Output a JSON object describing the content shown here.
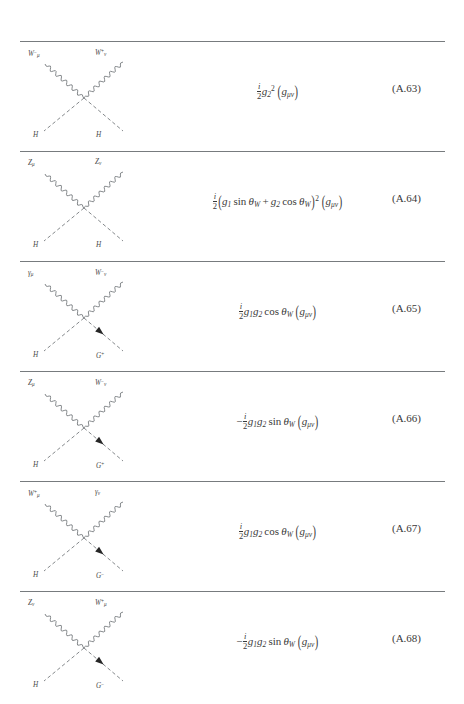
{
  "page": {
    "background": "#ffffff",
    "rule_color": "#777b7e",
    "text_color": "#3a3a3a"
  },
  "rows": [
    {
      "id": "row-a63",
      "diagram": {
        "name": "feynman-diagram-wwhh",
        "top_left": {
          "symbol": "W",
          "sub": "μ",
          "sup": "−"
        },
        "top_right": {
          "symbol": "W",
          "sub": "ν",
          "sup": "+"
        },
        "bottom_left": {
          "symbol": "H",
          "sub": "",
          "sup": ""
        },
        "bottom_right": {
          "symbol": "H",
          "sub": "",
          "sup": ""
        },
        "top_left_style": "wavy",
        "top_right_style": "wavy",
        "bottom_left_style": "dashed",
        "bottom_right_style": "dashed",
        "arrow": false
      },
      "equation": {
        "sign": "",
        "coefficient_num": "i",
        "coefficient_den": "2",
        "body": "g₂²",
        "tensor": "gμν",
        "plain": "i/2 g2^2 (g_munu)"
      },
      "tag": "(A.63)"
    },
    {
      "id": "row-a64",
      "diagram": {
        "name": "feynman-diagram-zzhh",
        "top_left": {
          "symbol": "Z",
          "sub": "μ",
          "sup": ""
        },
        "top_right": {
          "symbol": "Z",
          "sub": "ν",
          "sup": ""
        },
        "bottom_left": {
          "symbol": "H",
          "sub": "",
          "sup": ""
        },
        "bottom_right": {
          "symbol": "H",
          "sub": "",
          "sup": ""
        },
        "top_left_style": "wavy",
        "top_right_style": "wavy",
        "bottom_left_style": "dashed",
        "bottom_right_style": "dashed",
        "arrow": false
      },
      "equation": {
        "sign": "",
        "coefficient_num": "i",
        "coefficient_den": "2",
        "body": "(g₁ sin θW + g₂ cos θW)²",
        "tensor": "gμν",
        "plain": "i/2 (g1 sin thetaW + g2 cos thetaW)^2 (g_munu)"
      },
      "tag": "(A.64)"
    },
    {
      "id": "row-a65",
      "diagram": {
        "name": "feynman-diagram-gamma-w-h-gplus",
        "top_left": {
          "symbol": "γ",
          "sub": "μ",
          "sup": ""
        },
        "top_right": {
          "symbol": "W",
          "sub": "ν",
          "sup": "−"
        },
        "bottom_left": {
          "symbol": "H",
          "sub": "",
          "sup": ""
        },
        "bottom_right": {
          "symbol": "G",
          "sub": "",
          "sup": "+"
        },
        "top_left_style": "wavy",
        "top_right_style": "wavy",
        "bottom_left_style": "dashed",
        "bottom_right_style": "dashed",
        "arrow": true
      },
      "equation": {
        "sign": "",
        "coefficient_num": "i",
        "coefficient_den": "2",
        "body": "g₁g₂ cos θW",
        "tensor": "gμν",
        "plain": "i/2 g1 g2 cos thetaW (g_munu)"
      },
      "tag": "(A.65)"
    },
    {
      "id": "row-a66",
      "diagram": {
        "name": "feynman-diagram-z-w-h-gplus",
        "top_left": {
          "symbol": "Z",
          "sub": "μ",
          "sup": ""
        },
        "top_right": {
          "symbol": "W",
          "sub": "ν",
          "sup": "−"
        },
        "bottom_left": {
          "symbol": "H",
          "sub": "",
          "sup": ""
        },
        "bottom_right": {
          "symbol": "G",
          "sub": "",
          "sup": "+"
        },
        "top_left_style": "wavy",
        "top_right_style": "wavy",
        "bottom_left_style": "dashed",
        "bottom_right_style": "dashed",
        "arrow": true
      },
      "equation": {
        "sign": "−",
        "coefficient_num": "i",
        "coefficient_den": "2",
        "body": "g₁g₂ sin θW",
        "tensor": "gμν",
        "plain": "-i/2 g1 g2 sin thetaW (g_munu)"
      },
      "tag": "(A.66)"
    },
    {
      "id": "row-a67",
      "diagram": {
        "name": "feynman-diagram-w-gamma-h-gminus",
        "top_left": {
          "symbol": "W",
          "sub": "μ",
          "sup": "+"
        },
        "top_right": {
          "symbol": "γ",
          "sub": "ν",
          "sup": ""
        },
        "bottom_left": {
          "symbol": "H",
          "sub": "",
          "sup": ""
        },
        "bottom_right": {
          "symbol": "G",
          "sub": "",
          "sup": "−"
        },
        "top_left_style": "wavy",
        "top_right_style": "wavy",
        "bottom_left_style": "dashed",
        "bottom_right_style": "dashed",
        "arrow": true
      },
      "equation": {
        "sign": "",
        "coefficient_num": "i",
        "coefficient_den": "2",
        "body": "g₁g₂ cos θW",
        "tensor": "gμν",
        "plain": "i/2 g1 g2 cos thetaW (g_munu)"
      },
      "tag": "(A.67)"
    },
    {
      "id": "row-a68",
      "diagram": {
        "name": "feynman-diagram-z-w-h-gminus",
        "top_left": {
          "symbol": "Z",
          "sub": "ν",
          "sup": ""
        },
        "top_right": {
          "symbol": "W",
          "sub": "μ",
          "sup": "+"
        },
        "bottom_left": {
          "symbol": "H",
          "sub": "",
          "sup": ""
        },
        "bottom_right": {
          "symbol": "G",
          "sub": "",
          "sup": "−"
        },
        "top_left_style": "wavy",
        "top_right_style": "wavy",
        "bottom_left_style": "dashed",
        "bottom_right_style": "dashed",
        "arrow": true
      },
      "equation": {
        "sign": "−",
        "coefficient_num": "i",
        "coefficient_den": "2",
        "body": "g₁g₂ sin θW",
        "tensor": "gμν",
        "plain": "-i/2 g1 g2 sin thetaW (g_munu)"
      },
      "tag": "(A.68)"
    }
  ]
}
